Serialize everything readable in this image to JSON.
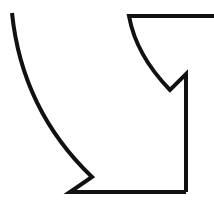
{
  "diagram": {
    "stroke_color": "#111111",
    "background": "#ffffff",
    "stroke_width": 4,
    "shapes": [
      {
        "name": "left-arc-with-bottom-zigzag",
        "path": "M 12 13 Q 22 110 92 177 L 70 192 L 186 192"
      },
      {
        "name": "right-edge-notch-and-upper-arc",
        "path": "M 186 192 L 186 74 L 170 90 Q 136 55 129 16 L 216 16"
      }
    ]
  }
}
